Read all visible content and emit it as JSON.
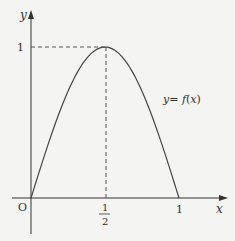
{
  "chart_data": {
    "type": "line",
    "title": "",
    "xlabel": "x",
    "ylabel": "y",
    "curve_label": "y = f(x)",
    "origin_label": "O",
    "x_ticks": [
      {
        "value": 0.5,
        "label_num": "1",
        "label_den": "2"
      },
      {
        "value": 1,
        "label": "1"
      }
    ],
    "y_ticks": [
      {
        "value": 1,
        "label": "1"
      }
    ],
    "series": [
      {
        "name": "y = f(x)",
        "x": [
          0,
          0.1,
          0.2,
          0.3,
          0.4,
          0.5,
          0.6,
          0.7,
          0.8,
          0.9,
          1.0
        ],
        "y": [
          0,
          0.31,
          0.59,
          0.81,
          0.95,
          1.0,
          0.95,
          0.81,
          0.59,
          0.31,
          0
        ]
      }
    ],
    "annotations": [
      {
        "type": "dashed-line",
        "from": [
          0,
          1
        ],
        "to": [
          0.5,
          1
        ]
      },
      {
        "type": "dashed-line",
        "from": [
          0.5,
          1
        ],
        "to": [
          0.5,
          0
        ]
      }
    ],
    "maximum": {
      "x": 0.5,
      "y": 1
    },
    "xlim": [
      0,
      1.1
    ],
    "ylim": [
      0,
      1.2
    ],
    "grid": false,
    "colors": {
      "axis": "#333333",
      "curve": "#444444",
      "dashed": "#555555",
      "background": "#f4f4f2"
    }
  },
  "labels": {
    "y_axis": "y",
    "x_axis": "x",
    "origin": "O",
    "y_tick_1": "1",
    "x_tick_half_num": "1",
    "x_tick_half_den": "2",
    "x_tick_1": "1",
    "curve_y": "y",
    "curve_eq": "= ",
    "curve_f": "f",
    "curve_paren_open": "(",
    "curve_x": "x",
    "curve_paren_close": ")"
  }
}
